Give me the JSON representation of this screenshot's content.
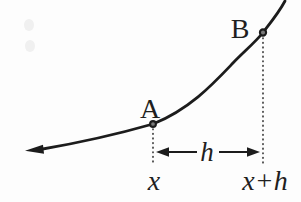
{
  "figure": {
    "point_a_label": "A",
    "point_b_label": "B",
    "h_label": "h",
    "x_tick_label": "x",
    "x_plus_h_tick_label": "x+h"
  },
  "colors": {
    "background": "#fdfdfd",
    "curve": "#1c1c1c",
    "dotted_line": "#3a3a3a",
    "text": "#1f1f1f",
    "dot_center": "#7a7a7a",
    "scan_smudge": "#e9e9e9"
  }
}
